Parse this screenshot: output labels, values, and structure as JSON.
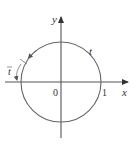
{
  "diagram": {
    "labels": {
      "x_axis": "x",
      "y_axis": "y",
      "origin": "0",
      "one": "1",
      "t": "t",
      "t_bar": "t"
    },
    "colors": {
      "stroke": "#555555",
      "text": "#333333"
    }
  }
}
